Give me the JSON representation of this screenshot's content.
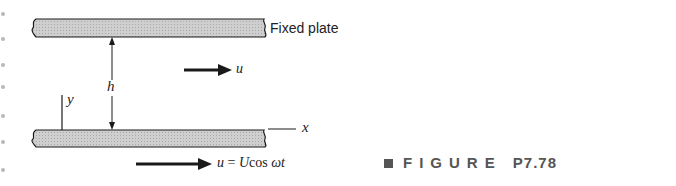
{
  "figure": {
    "fixed_plate_label": "Fixed plate",
    "gap_label": "h",
    "velocity_label": "u",
    "y_axis_label": "y",
    "x_axis_label": "x",
    "bottom_velocity": {
      "lhs": "u",
      "equals": " = ",
      "amplitude": "U",
      "func": "cos ",
      "arg": "ωt"
    },
    "caption": {
      "word": "FIGURE",
      "number": "P7.78"
    }
  },
  "colors": {
    "plate_fill": "#c8c8c8",
    "line": "#1a1a1a",
    "caption": "#555555"
  }
}
